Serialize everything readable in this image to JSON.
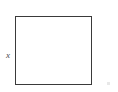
{
  "figure": {
    "type": "geometry-diagram",
    "canvas": {
      "width": 118,
      "height": 92,
      "background_color": "#ffffff"
    },
    "shape": {
      "name": "square",
      "stroke_color": "#3a3a3a",
      "stroke_width": 1.5,
      "fill_color": "#ffffff",
      "x": 15,
      "y": 16,
      "width": 77,
      "height": 69
    },
    "labels": [
      {
        "name": "side-length-label",
        "text": "x",
        "style": "italic-serif",
        "color": "#4a4a4a",
        "x": 4,
        "y": 53
      }
    ],
    "artifacts": [
      {
        "name": "corner-speck",
        "color": "#e8e8e8",
        "x": 107,
        "y": 82
      }
    ]
  }
}
